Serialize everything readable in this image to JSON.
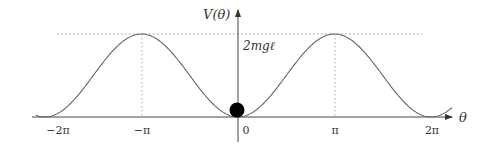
{
  "figure": {
    "y_axis_label": "V(θ)",
    "x_axis_label": "θ",
    "max_label": "2mgℓ",
    "x_ticks": [
      {
        "label": "−2π",
        "x": 58
      },
      {
        "label": "−π",
        "x": 142
      },
      {
        "label": "0",
        "x": 244
      },
      {
        "label": "π",
        "x": 335
      },
      {
        "label": "2π",
        "x": 432
      }
    ],
    "curve": "V(θ) = mgℓ(1 − cos θ)",
    "ball": "equilibrium at θ = 0",
    "colors": {
      "curve": "#666666",
      "axis": "#444444",
      "dotted": "#999999",
      "ball": "#000000"
    }
  }
}
